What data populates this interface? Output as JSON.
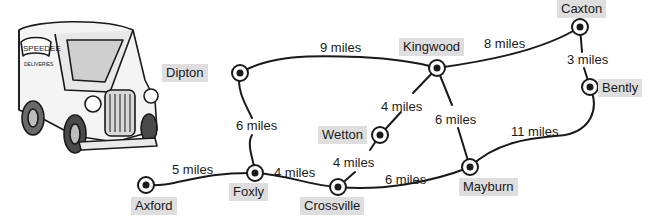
{
  "illustration": {
    "subject": "delivery-van",
    "van_sign_line1": "SPEEDEE",
    "van_sign_line2": "DELIVERIES"
  },
  "towns": [
    {
      "id": "caxton",
      "name": "Caxton",
      "x": 580,
      "y": 27,
      "label": {
        "x": 557,
        "y": 0
      }
    },
    {
      "id": "bently",
      "name": "Bently",
      "x": 590,
      "y": 87,
      "label": {
        "x": 598,
        "y": 79
      }
    },
    {
      "id": "kingwood",
      "name": "Kingwood",
      "x": 437,
      "y": 68,
      "label": {
        "x": 399,
        "y": 38
      }
    },
    {
      "id": "dipton",
      "name": "Dipton",
      "x": 240,
      "y": 73,
      "label": {
        "x": 162,
        "y": 64
      }
    },
    {
      "id": "wetton",
      "name": "Wetton",
      "x": 380,
      "y": 135,
      "label": {
        "x": 318,
        "y": 126
      }
    },
    {
      "id": "mayburn",
      "name": "Mayburn",
      "x": 470,
      "y": 167,
      "label": {
        "x": 459,
        "y": 178
      }
    },
    {
      "id": "foxly",
      "name": "Foxly",
      "x": 255,
      "y": 173,
      "label": {
        "x": 229,
        "y": 183
      }
    },
    {
      "id": "crossville",
      "name": "Crossville",
      "x": 338,
      "y": 187,
      "label": {
        "x": 300,
        "y": 197
      }
    },
    {
      "id": "axford",
      "name": "Axford",
      "x": 146,
      "y": 185,
      "label": {
        "x": 131,
        "y": 197
      }
    }
  ],
  "routes": [
    {
      "from": "Axford",
      "to": "Foxly",
      "distance": "5 miles",
      "label": {
        "x": 172,
        "y": 162
      }
    },
    {
      "from": "Foxly",
      "to": "Crossville",
      "distance": "4 miles",
      "label": {
        "x": 274,
        "y": 165
      }
    },
    {
      "from": "Dipton",
      "to": "Foxly",
      "distance": "6 miles",
      "label": {
        "x": 236,
        "y": 118
      }
    },
    {
      "from": "Dipton",
      "to": "Kingwood",
      "distance": "9 miles",
      "label": {
        "x": 320,
        "y": 40
      }
    },
    {
      "from": "Kingwood",
      "to": "Caxton",
      "distance": "8 miles",
      "label": {
        "x": 484,
        "y": 36
      }
    },
    {
      "from": "Caxton",
      "to": "Bently",
      "distance": "3 miles",
      "label": {
        "x": 567,
        "y": 52
      }
    },
    {
      "from": "Kingwood",
      "to": "Wetton",
      "distance": "4 miles",
      "label": {
        "x": 381,
        "y": 99
      }
    },
    {
      "from": "Wetton",
      "to": "Crossville",
      "distance": "4 miles",
      "label": {
        "x": 333,
        "y": 155
      }
    },
    {
      "from": "Kingwood",
      "to": "Mayburn",
      "distance": "6 miles",
      "label": {
        "x": 435,
        "y": 112
      }
    },
    {
      "from": "Crossville",
      "to": "Mayburn",
      "distance": "6 miles",
      "label": {
        "x": 385,
        "y": 172
      }
    },
    {
      "from": "Mayburn",
      "to": "Bently",
      "distance": "11 miles",
      "label": {
        "x": 511,
        "y": 124
      }
    }
  ],
  "colors": {
    "label_bg": "#dedede",
    "line": "#1a1a1a",
    "background": "#ffffff"
  }
}
